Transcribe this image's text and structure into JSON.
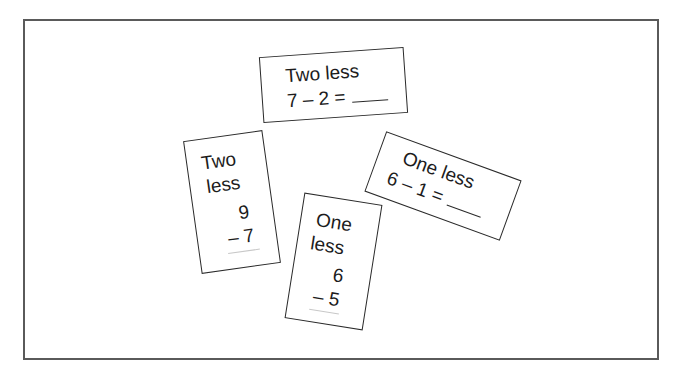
{
  "figure": {
    "cards": [
      {
        "id": "card-top",
        "heading": "Two less",
        "equation": "7 – 2 =",
        "blank": "____",
        "layout": "horizontal"
      },
      {
        "id": "card-left",
        "heading_line1": "Two",
        "heading_line2": "less",
        "top_number": "9",
        "bottom_number": "– 7",
        "layout": "vertical"
      },
      {
        "id": "card-bottom",
        "heading_line1": "One",
        "heading_line2": "less",
        "top_number": "6",
        "bottom_number": "– 5",
        "layout": "vertical"
      },
      {
        "id": "card-right",
        "heading": "One less",
        "equation": "6 – 1 =",
        "blank": "____",
        "layout": "horizontal"
      }
    ],
    "colors": {
      "frame_border": "#5a5a5a",
      "card_border": "#2a2a2a",
      "text": "#1c1c1c",
      "answer_rule": "#c8c8c8"
    }
  }
}
